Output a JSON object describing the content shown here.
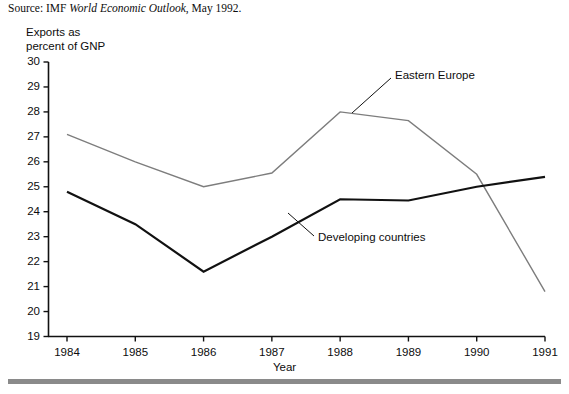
{
  "source": {
    "prefix": "Source: IMF ",
    "publication": "World Economic Outlook",
    "suffix": ", May 1992."
  },
  "chart_data": {
    "type": "line",
    "title": "",
    "subtitle": "",
    "xlabel": "Year",
    "ylabel": "Exports as\npercent of GNP",
    "categories": [
      "1984",
      "1985",
      "1986",
      "1987",
      "1988",
      "1989",
      "1990",
      "1991"
    ],
    "x": [
      1984,
      1985,
      1986,
      1987,
      1988,
      1989,
      1990,
      1991
    ],
    "xlim": [
      1984,
      1991
    ],
    "ylim": [
      19,
      30
    ],
    "yticks": [
      19,
      20,
      21,
      22,
      23,
      24,
      25,
      26,
      27,
      28,
      29,
      30
    ],
    "grid": false,
    "legend_position": "inline-annotations",
    "series": [
      {
        "name": "Eastern Europe",
        "color": "#7d7d7d",
        "width": 1.4,
        "values": [
          27.1,
          26.0,
          25.0,
          25.55,
          28.0,
          27.65,
          25.5,
          20.8
        ]
      },
      {
        "name": "Developing countries",
        "color": "#111111",
        "width": 2.2,
        "values": [
          24.8,
          23.5,
          21.6,
          23.0,
          24.5,
          24.45,
          25.0,
          25.4
        ]
      }
    ],
    "annotations": [
      {
        "text": "Eastern Europe",
        "series": "Eastern Europe",
        "label_x": 395,
        "label_y": 69,
        "leader_from": [
          391,
          78
        ],
        "leader_to": [
          352,
          113
        ]
      },
      {
        "text": "Developing countries",
        "series": "Developing countries",
        "label_x": 318,
        "label_y": 231,
        "leader_from": [
          314,
          236
        ],
        "leader_to": [
          288,
          213
        ]
      }
    ]
  },
  "colors": {
    "eastern_europe": "#7d7d7d",
    "developing_countries": "#111111",
    "axis": "#111111",
    "rule": "#8a8a8a",
    "background": "#ffffff"
  }
}
